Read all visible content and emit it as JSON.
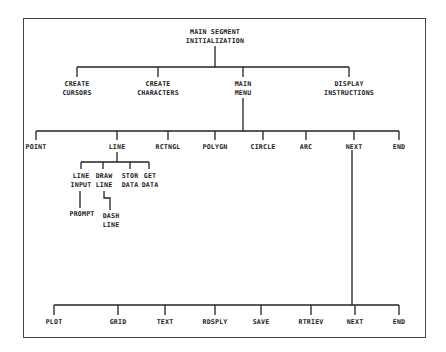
{
  "diagram": {
    "root": {
      "line1": "MAIN SEGMENT",
      "line2": "INITIALIZATION"
    },
    "level1": [
      {
        "line1": "CREATE",
        "line2": "CURSORS"
      },
      {
        "line1": "CREATE",
        "line2": "CHARACTERS"
      },
      {
        "line1": "MAIN",
        "line2": "MENU"
      },
      {
        "line1": "DISPLAY",
        "line2": "INSTRUCTIONS"
      }
    ],
    "main_menu": [
      "POINT",
      "LINE",
      "RCTNGL",
      "POLYGN",
      "CIRCLE",
      "ARC",
      "NEXT",
      "END"
    ],
    "line_submenu": [
      {
        "line1": "LINE",
        "line2": "INPUT"
      },
      {
        "line1": "DRAW",
        "line2": "LINE"
      },
      {
        "line1": "STOR",
        "line2": "DATA"
      },
      {
        "line1": "GET",
        "line2": "DATA"
      }
    ],
    "line_input_child": "PROMPT",
    "draw_line_child": {
      "line1": "DASH",
      "line2": "LINE"
    },
    "next_menu": [
      "PLOT",
      "GRID",
      "TEXT",
      "RDSPLY",
      "SAVE",
      "RTRIEV",
      "NEXT",
      "END"
    ]
  }
}
